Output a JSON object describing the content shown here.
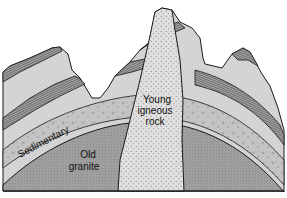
{
  "diagram": {
    "type": "geological-cross-section",
    "labels": {
      "sedimentary": "Sedimentary",
      "old_granite_line1": "Old",
      "old_granite_line2": "granite",
      "young_igneous_line1": "Young",
      "young_igneous_line2": "igneous",
      "young_igneous_line3": "rock"
    },
    "colors": {
      "background": "#ffffff",
      "outline": "#1a1a1a",
      "sediment_light": "#d4d4d4",
      "sediment_band": "#8c8c8c",
      "pebbly_layer": "#c2c2c2",
      "granite": "#9a9a9a",
      "igneous_intrusion": "#dcdcdc"
    }
  }
}
